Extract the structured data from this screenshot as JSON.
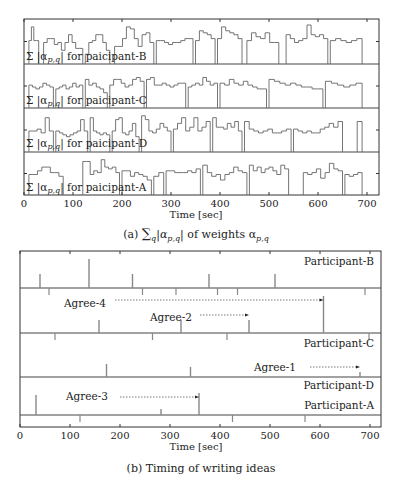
{
  "chart_data": [
    {
      "type": "line",
      "subtype": "step",
      "title": "(a) Σ_q |α_{p,q}| of weights α_{p,q}",
      "caption": "(a) ∑q |αp,q| of weights αp,q",
      "xlabel": "Time [sec]",
      "ylabel": "",
      "xlim": [
        0,
        720
      ],
      "xticks": [
        0,
        100,
        200,
        300,
        400,
        500,
        600,
        700
      ],
      "grid": false,
      "panels": [
        {
          "name": "participant-B",
          "label": "Σ |αp,q| for paicipant-B",
          "segments": [
            [
              10,
              30,
              [
                0.55,
                0.9,
                0.55,
                0.55
              ]
            ],
            [
              40,
              120,
              [
                0.5,
                0.6,
                0.6,
                0.45,
                0.5,
                0.3,
                0.5,
                0.7,
                0.5,
                0.35,
                0.35
              ]
            ],
            [
              125,
              175,
              [
                0.2,
                0.5,
                0.55,
                0.7,
                0.7,
                0.5,
                0.3
              ]
            ],
            [
              185,
              265,
              [
                0.4,
                0.4,
                0.6,
                0.9,
                0.85,
                0.6,
                0.4,
                0.7,
                0.75,
                0.5
              ]
            ],
            [
              270,
              345,
              [
                0.55,
                0.55,
                0.5,
                0.45,
                0.5,
                0.5,
                0.55,
                0.6,
                0.6
              ]
            ],
            [
              350,
              390,
              [
                0.55,
                0.8,
                0.75,
                0.7,
                0.6
              ]
            ],
            [
              395,
              445,
              [
                0.6,
                0.9,
                0.8,
                0.75,
                0.7,
                0.6
              ]
            ],
            [
              455,
              520,
              [
                0.55,
                0.75,
                0.65,
                0.6,
                0.75,
                0.5,
                0.5
              ]
            ],
            [
              535,
              620,
              [
                0.7,
                0.6,
                0.5,
                0.55,
                0.6,
                0.95,
                0.7,
                0.65,
                0.7,
                0.6
              ]
            ],
            [
              625,
              690,
              [
                0.55,
                0.6,
                0.55,
                0.5,
                0.55,
                0.6
              ]
            ]
          ]
        },
        {
          "name": "participant-C",
          "label": "Σ |αp,q| for paicipant-C",
          "segments": [
            [
              10,
              60,
              [
                0.55,
                0.5,
                0.45,
                0.5,
                0.6,
                0.55,
                0.5
              ]
            ],
            [
              65,
              120,
              [
                0.45,
                0.5,
                0.55,
                0.45,
                0.5,
                0.6,
                0.5,
                0.55
              ]
            ],
            [
              125,
              170,
              [
                0.7,
                0.55,
                0.6,
                0.5,
                0.45,
                0.35
              ]
            ],
            [
              175,
              245,
              [
                0.55,
                0.7,
                0.7,
                0.6,
                0.5,
                0.55,
                0.7,
                0.75,
                0.65
              ]
            ],
            [
              250,
              330,
              [
                0.7,
                0.75,
                0.55,
                0.55,
                0.6,
                0.55,
                0.5,
                0.55,
                0.6,
                0.6
              ]
            ],
            [
              335,
              395,
              [
                0.5,
                0.55,
                0.6,
                0.55,
                0.75,
                0.65,
                0.55,
                0.6
              ]
            ],
            [
              400,
              495,
              [
                0.6,
                0.55,
                0.7,
                0.6,
                0.55,
                0.65,
                0.55,
                0.5,
                0.45,
                0.45
              ]
            ],
            [
              500,
              610,
              [
                0.7,
                0.65,
                0.6,
                0.55,
                0.6,
                0.55,
                0.5,
                0.5,
                0.45,
                0.45
              ]
            ],
            [
              615,
              690,
              [
                0.65,
                0.6,
                0.55,
                0.5,
                0.55,
                0.6
              ]
            ]
          ]
        },
        {
          "name": "participant-D",
          "label": "Σ |αp,q| for paicipant-D",
          "segments": [
            [
              10,
              60,
              [
                0.5,
                0.5,
                0.55,
                0.45,
                0.85,
                0.5
              ]
            ],
            [
              65,
              130,
              [
                0.5,
                0.45,
                0.4,
                0.35,
                0.4,
                0.45,
                0.5,
                0.8,
                0.5
              ]
            ],
            [
              135,
              175,
              [
                0.85,
                0.5,
                0.45,
                0.4,
                0.45,
                0.4
              ]
            ],
            [
              180,
              235,
              [
                0.5,
                0.8,
                0.85,
                0.45,
                0.4,
                0.5,
                0.7,
                0.35
              ]
            ],
            [
              240,
              300,
              [
                0.9,
                0.8,
                0.5,
                0.45,
                0.55,
                0.7,
                0.6,
                0.5
              ]
            ],
            [
              305,
              380,
              [
                0.55,
                0.7,
                0.85,
                0.5,
                0.6,
                0.85,
                0.5,
                0.6,
                0.75
              ]
            ],
            [
              385,
              445,
              [
                0.85,
                0.6,
                0.6,
                0.55,
                0.7,
                0.6,
                0.75,
                0.5
              ]
            ],
            [
              450,
              545,
              [
                0.75,
                0.55,
                0.5,
                0.45,
                0.5,
                0.55,
                0.45,
                0.45,
                0.5,
                0.55
              ]
            ],
            [
              550,
              650,
              [
                0.55,
                0.5,
                0.45,
                0.5,
                0.45,
                0.45,
                0.55,
                0.6,
                0.7,
                0.6,
                0.75
              ]
            ],
            [
              680,
              690,
              [
                0.75
              ]
            ]
          ]
        },
        {
          "name": "participant-A",
          "label": "Σ |αp,q| for paicipant-A",
          "segments": [
            [
              10,
              80,
              [
                0.5,
                0.5,
                0.6,
                0.7,
                0.7,
                0.55,
                0.55,
                0.45
              ]
            ],
            [
              120,
              195,
              [
                0.85,
                0.85,
                0.5,
                0.6,
                0.55,
                0.9,
                0.7,
                0.65,
                0.7,
                0.55
              ]
            ],
            [
              200,
              260,
              [
                0.6,
                0.6,
                0.45,
                0.55,
                0.5,
                0.45,
                0.35
              ]
            ],
            [
              265,
              285,
              [
                0.45,
                0.55
              ]
            ],
            [
              290,
              360,
              [
                0.6,
                0.6,
                0.55,
                0.55,
                0.55,
                0.6,
                0.55,
                0.65
              ]
            ],
            [
              365,
              455,
              [
                0.75,
                0.55,
                0.45,
                0.5,
                0.35,
                0.5,
                0.55,
                0.7,
                0.6,
                0.55
              ]
            ],
            [
              460,
              540,
              [
                0.75,
                0.6,
                0.7,
                0.55,
                0.65,
                0.7,
                0.6,
                0.5,
                0.75,
                0.65
              ]
            ],
            [
              570,
              650,
              [
                0.55,
                0.5,
                0.55,
                0.65,
                0.4,
                0.55,
                0.8,
                0.65,
                0.6
              ]
            ],
            [
              655,
              690,
              [
                0.5,
                0.45,
                0.5,
                0.55
              ]
            ]
          ]
        }
      ]
    },
    {
      "type": "event",
      "title": "(b) Timing of writing ideas",
      "caption": "(b) Timing of writing ideas",
      "xlabel": "Time [sec]",
      "xlim": [
        0,
        720
      ],
      "xticks": [
        0,
        100,
        200,
        300,
        400,
        500,
        600,
        700
      ],
      "grid": false,
      "rows": [
        {
          "name": "Participant-B",
          "events_up": [
            40,
            138,
            225,
            378,
            510
          ],
          "events_down": [
            312,
            435
          ]
        },
        {
          "name": "Participant-C",
          "events_up": [
            158,
            322,
            458,
            607
          ],
          "events_down": [
            58,
            245,
            395,
            690
          ]
        },
        {
          "name": "Participant-D",
          "events_up": [
            173,
            341,
            680
          ],
          "events_down": [
            70,
            265,
            414,
            698
          ]
        },
        {
          "name": "Participant-A",
          "events_up": [
            32,
            282,
            358
          ],
          "events_down": [
            120,
            425,
            570
          ]
        }
      ],
      "annotations": [
        {
          "label": "Agree-4",
          "arrow_from": 190,
          "arrow_to": 607,
          "row": "Participant-B/C"
        },
        {
          "label": "Agree-2",
          "arrow_from": 360,
          "arrow_to": 458,
          "row": "Participant-B/C"
        },
        {
          "label": "Agree-1",
          "arrow_from": 580,
          "arrow_to": 680,
          "row": "Participant-C/D"
        },
        {
          "label": "Agree-3",
          "arrow_from": 200,
          "arrow_to": 358,
          "row": "Participant-D/A"
        }
      ]
    }
  ],
  "figure": {
    "top": {
      "caption_prefix": "(a) ",
      "caption_sum": "∑",
      "caption_sub_q": "q",
      "caption_abs": "|α",
      "caption_sub_pq": "p,q",
      "caption_mid": "| of weights α",
      "xlabel": "Time [sec]",
      "xticks": [
        "0",
        "100",
        "200",
        "300",
        "400",
        "500",
        "600",
        "700"
      ],
      "panel_label_prefix": "Σ |α",
      "panel_label_sub": "p,q",
      "panel_labels": [
        "| for paicipant-B",
        "| for paicipant-C",
        "| for paicipant-D",
        "| for paicipant-A"
      ]
    },
    "bottom": {
      "caption": "(b) Timing of writing ideas",
      "xlabel": "Time [sec]",
      "xticks": [
        "0",
        "100",
        "200",
        "300",
        "400",
        "500",
        "600",
        "700"
      ],
      "row_labels": [
        "Participant-B",
        "Participant-C",
        "Participant-D",
        "Participant-A"
      ],
      "agree_labels": [
        "Agree-4",
        "Agree-2",
        "Agree-1",
        "Agree-3"
      ]
    },
    "colors": {
      "frame": "#333333",
      "series": "#666666",
      "events": "#888888",
      "text": "#222222"
    }
  }
}
